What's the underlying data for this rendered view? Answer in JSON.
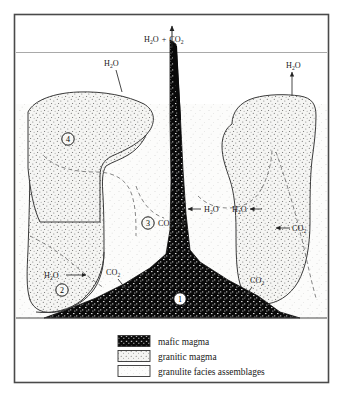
{
  "figure": {
    "border_color": "#4a4a4a",
    "background_color": "#ffffff"
  },
  "colors": {
    "mafic_magma": "#0a0a0a",
    "granitic_magma": "#f2f2f0",
    "granulite": "#fbfbfa",
    "line": "#333333",
    "dashed_line": "#6b6b6b",
    "text": "#1a1a1a"
  },
  "surface": {
    "emission_label": "H₂O + CO₂",
    "emission_label_h2o": "H",
    "emission_label_h2o_sub": "2",
    "emission_label_o": "O",
    "emission_plus": "+",
    "emission_label_co": "CO",
    "emission_label_co_sub": "2"
  },
  "annotations": [
    {
      "id": "h2o-top-left",
      "text": "H₂O",
      "base": "H",
      "sub": "2",
      "tail": "O",
      "x": 112,
      "y": 66,
      "arrow": "up"
    },
    {
      "id": "h2o-top-right",
      "text": "H₂O",
      "base": "H",
      "sub": "2",
      "tail": "O",
      "x": 292,
      "y": 68,
      "arrow": "up"
    },
    {
      "id": "h2o-center",
      "text": "H₂O",
      "base": "H",
      "sub": "2",
      "tail": "O",
      "x": 203,
      "y": 209,
      "arrow": "left"
    },
    {
      "id": "co2-center",
      "text": "CO₂",
      "base": "CO",
      "sub": "2",
      "tail": "",
      "x": 168,
      "y": 223,
      "arrow": "right"
    },
    {
      "id": "h2o-right-inner",
      "text": "H₂O",
      "base": "H",
      "sub": "2",
      "tail": "O",
      "x": 238,
      "y": 209,
      "arrow": "left"
    },
    {
      "id": "co2-right-outer",
      "text": "CO₂",
      "base": "CO",
      "sub": "2",
      "tail": "",
      "x": 292,
      "y": 228,
      "arrow": "left"
    },
    {
      "id": "h2o-lower-left",
      "text": "H₂O",
      "base": "H",
      "sub": "2",
      "tail": "O",
      "x": 52,
      "y": 275,
      "arrow": "right"
    },
    {
      "id": "co2-lower-left",
      "text": "CO₂",
      "base": "CO",
      "sub": "2",
      "tail": "",
      "x": 113,
      "y": 272,
      "arrow": "pointer"
    },
    {
      "id": "co2-lower-right",
      "text": "CO₂",
      "base": "CO",
      "sub": "2",
      "tail": "",
      "x": 256,
      "y": 280,
      "arrow": "pointer"
    }
  ],
  "numbered_markers": [
    {
      "id": "marker-1",
      "label": "1",
      "x": 180,
      "y": 299,
      "style": "on-dark"
    },
    {
      "id": "marker-2",
      "label": "2",
      "x": 62,
      "y": 290,
      "style": "on-light"
    },
    {
      "id": "marker-3",
      "label": "3",
      "x": 148,
      "y": 223,
      "style": "on-light"
    },
    {
      "id": "marker-4",
      "label": "4",
      "x": 68,
      "y": 139,
      "style": "on-light"
    }
  ],
  "legend": {
    "items": [
      {
        "id": "legend-mafic",
        "label": "mafic magma",
        "pattern": "mafic"
      },
      {
        "id": "legend-granitic",
        "label": "granitic magma",
        "pattern": "granitic"
      },
      {
        "id": "legend-granulite",
        "label": "granulite facies assemblages",
        "pattern": "granulite"
      }
    ]
  }
}
